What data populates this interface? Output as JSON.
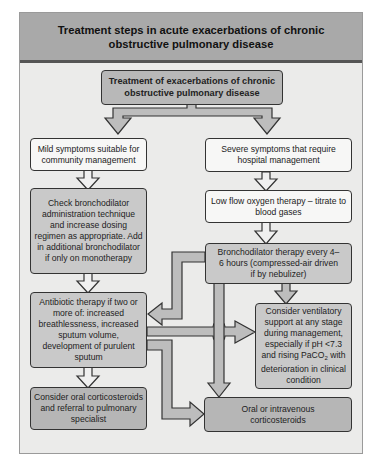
{
  "title": "Treatment steps in acute exacerbations of chronic obstructive pulmonary disease",
  "colors": {
    "header_bg": "#a9a9a9",
    "body_bg": "#ebebea",
    "box_light": "#f7f7f6",
    "box_gray": "#c9c9c9",
    "box_dark": "#b6b6b6",
    "arrow_fill": "#bdbdbd"
  },
  "nodes": {
    "root": "Treatment of exacerbations of chronic obstructive pulmonary disease",
    "mild": "Mild symptoms suitable for community management",
    "severe": "Severe symptoms that require hospital management",
    "check_bronchodilator": "Check bronchodilator administration technique and increase dosing regimen as appropriate. Add in additional bronchodilator if only on monotherapy",
    "low_flow_oxygen": "Low flow oxygen therapy – titrate to blood gases",
    "bronchodilator_therapy": "Bronchodilator therapy every 4–6 hours (compressed-air driven if by nebulizer)",
    "antibiotic": "Antibiotic therapy if two or more of: increased breathlessness, increased sputum volume, development of purulent sputum",
    "ventilatory_support_pre": "Consider ventilatory support at any stage during management, especially if pH <7.3 and rising PaCO",
    "ventilatory_support_sub": "2",
    "ventilatory_support_post": " with deterioration in clinical condition",
    "oral_corticosteroids_referral": "Consider oral corticosteroids and referral to pulmonary specialist",
    "oral_iv_corticosteroids": "Oral or intravenous corticosteroids"
  },
  "edges": [
    {
      "from": "root",
      "to": "mild"
    },
    {
      "from": "root",
      "to": "severe"
    },
    {
      "from": "mild",
      "to": "check_bronchodilator"
    },
    {
      "from": "check_bronchodilator",
      "to": "antibiotic"
    },
    {
      "from": "antibiotic",
      "to": "oral_corticosteroids_referral"
    },
    {
      "from": "antibiotic",
      "to": "ventilatory_support"
    },
    {
      "from": "antibiotic",
      "to": "oral_iv_corticosteroids"
    },
    {
      "from": "severe",
      "to": "low_flow_oxygen"
    },
    {
      "from": "low_flow_oxygen",
      "to": "bronchodilator_therapy"
    },
    {
      "from": "bronchodilator_therapy",
      "to": "ventilatory_support"
    },
    {
      "from": "bronchodilator_therapy",
      "to": "antibiotic"
    },
    {
      "from": "bronchodilator_therapy",
      "to": "oral_iv_corticosteroids"
    }
  ]
}
